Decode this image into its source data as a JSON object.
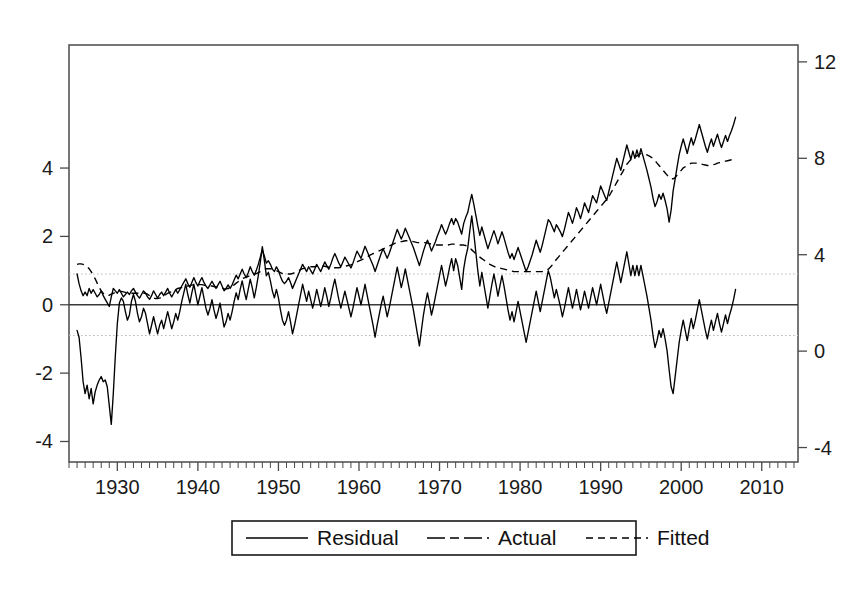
{
  "chart_data": {
    "type": "line",
    "title": "",
    "subtitle": "",
    "xlabel": "",
    "ylabel": "",
    "grid": false,
    "legend_position": "bottom-center",
    "x_start": 1925,
    "x_end": 2013,
    "x_tick_labels": [
      "1930",
      "1940",
      "1950",
      "1960",
      "1970",
      "1980",
      "1990",
      "2000",
      "2010"
    ],
    "x_tick_values": [
      1930,
      1940,
      1950,
      1960,
      1970,
      1980,
      1990,
      2000,
      2010
    ],
    "x_minor_tick_step": 1,
    "xlim": [
      1924,
      2014.5
    ],
    "left_axis": {
      "tick_labels": [
        "4",
        "2",
        "0",
        "-2",
        "-4"
      ],
      "tick_values": [
        4,
        2,
        0,
        -2,
        -4
      ],
      "ylim": [
        -4.6,
        7.6
      ],
      "applies_to": "Residual"
    },
    "right_axis": {
      "tick_labels": [
        "12",
        "8",
        "4",
        "0",
        "-4"
      ],
      "tick_values": [
        12,
        8,
        4,
        0,
        -4
      ],
      "ylim": [
        -4.6,
        12.7
      ],
      "applies_to": "Actual, Fitted"
    },
    "reference_lines": [
      {
        "name": "zero-line",
        "axis": "left",
        "value": 0,
        "style": "solid"
      },
      {
        "name": "upper-band",
        "axis": "left",
        "value": 0.9,
        "style": "dotted"
      },
      {
        "name": "lower-band",
        "axis": "left",
        "value": -0.9,
        "style": "dotted"
      }
    ],
    "series": [
      {
        "name": "Residual",
        "axis": "left",
        "style": "solid",
        "x_start": 1925.0,
        "x_step": 0.25,
        "values": [
          -0.75,
          -0.95,
          -1.55,
          -2.25,
          -2.6,
          -2.35,
          -2.75,
          -2.45,
          -2.9,
          -2.55,
          -2.35,
          -2.2,
          -2.1,
          -2.25,
          -2.2,
          -2.4,
          -2.95,
          -3.5,
          -2.6,
          -1.5,
          -0.55,
          0.05,
          0.2,
          0.1,
          -0.2,
          -0.45,
          -0.3,
          0.1,
          0.3,
          0.1,
          -0.25,
          -0.5,
          -0.35,
          -0.1,
          -0.25,
          -0.55,
          -0.85,
          -0.6,
          -0.35,
          -0.6,
          -0.85,
          -0.6,
          -0.45,
          -0.7,
          -0.45,
          -0.2,
          -0.45,
          -0.7,
          -0.5,
          -0.25,
          -0.45,
          -0.2,
          0.1,
          0.35,
          0.6,
          0.3,
          0.05,
          0.35,
          0.6,
          0.3,
          0.0,
          0.25,
          0.5,
          0.2,
          -0.1,
          -0.3,
          -0.1,
          0.15,
          -0.15,
          -0.4,
          -0.2,
          0.05,
          -0.3,
          -0.65,
          -0.5,
          -0.25,
          -0.45,
          -0.2,
          0.1,
          0.35,
          0.15,
          0.45,
          0.7,
          0.4,
          0.15,
          0.45,
          0.75,
          0.5,
          0.2,
          0.5,
          0.85,
          1.25,
          1.7,
          1.3,
          0.85,
          0.95,
          0.7,
          0.4,
          0.2,
          0.45,
          0.2,
          -0.15,
          -0.45,
          -0.6,
          -0.45,
          -0.2,
          -0.5,
          -0.85,
          -0.6,
          -0.3,
          0.0,
          0.3,
          0.6,
          0.35,
          0.1,
          0.4,
          0.15,
          -0.1,
          0.15,
          0.45,
          0.2,
          -0.05,
          0.2,
          0.5,
          0.25,
          -0.05,
          0.2,
          0.5,
          0.75,
          0.45,
          0.15,
          -0.1,
          0.15,
          0.4,
          0.15,
          -0.1,
          -0.35,
          -0.1,
          0.2,
          0.5,
          0.25,
          0.0,
          0.3,
          0.6,
          0.3,
          0.0,
          -0.3,
          -0.6,
          -0.95,
          -0.6,
          -0.3,
          0.0,
          0.25,
          -0.05,
          -0.35,
          -0.1,
          0.2,
          0.5,
          0.8,
          1.1,
          0.8,
          0.5,
          0.75,
          1.05,
          0.75,
          0.45,
          0.15,
          -0.15,
          -0.5,
          -0.85,
          -1.2,
          -0.75,
          -0.3,
          0.05,
          0.35,
          0.05,
          -0.3,
          -0.05,
          0.25,
          0.55,
          0.85,
          1.15,
          0.85,
          0.55,
          0.8,
          1.1,
          1.35,
          1.0,
          1.35,
          1.15,
          0.8,
          0.45,
          1.05,
          1.4,
          1.65,
          2.15,
          2.6,
          2.1,
          1.55,
          1.0,
          0.55,
          0.95,
          0.6,
          0.25,
          -0.1,
          0.25,
          0.6,
          0.9,
          0.6,
          0.25,
          0.55,
          0.85,
          0.55,
          0.2,
          -0.15,
          -0.45,
          -0.2,
          -0.5,
          -0.2,
          0.1,
          -0.2,
          -0.5,
          -0.8,
          -1.1,
          -0.8,
          -0.5,
          -0.2,
          0.1,
          0.4,
          0.1,
          -0.2,
          0.1,
          0.4,
          0.7,
          1.0,
          0.8,
          0.5,
          0.2,
          0.45,
          0.2,
          -0.05,
          -0.35,
          -0.1,
          0.2,
          0.5,
          0.2,
          -0.1,
          0.15,
          0.45,
          0.15,
          -0.15,
          0.1,
          0.4,
          0.15,
          -0.1,
          0.2,
          0.5,
          0.25,
          0.0,
          0.3,
          0.6,
          0.3,
          0.0,
          -0.25,
          0.05,
          0.35,
          0.65,
          0.95,
          1.25,
          0.95,
          0.65,
          0.95,
          1.25,
          1.55,
          1.2,
          0.85,
          1.15,
          0.85,
          1.15,
          0.85,
          1.15,
          0.85,
          0.55,
          0.25,
          -0.1,
          -0.45,
          -0.9,
          -1.25,
          -1.05,
          -0.75,
          -0.95,
          -0.7,
          -1.0,
          -1.35,
          -1.9,
          -2.4,
          -2.6,
          -2.1,
          -1.6,
          -1.1,
          -0.75,
          -0.45,
          -0.75,
          -1.05,
          -0.7,
          -0.4,
          -0.7,
          -0.45,
          -0.15,
          0.15,
          -0.15,
          -0.45,
          -0.75,
          -1.0,
          -0.7,
          -0.45,
          -0.75,
          -0.5,
          -0.25,
          -0.55,
          -0.8,
          -0.55,
          -0.3,
          -0.55,
          -0.3,
          -0.1,
          0.15,
          0.45
        ]
      },
      {
        "name": "Actual",
        "axis": "right",
        "style": "dash-dot",
        "x_start": 1925.0,
        "x_step": 0.25,
        "values": [
          3.2,
          2.8,
          2.5,
          2.3,
          2.45,
          2.3,
          2.6,
          2.4,
          2.55,
          2.4,
          2.25,
          2.35,
          2.5,
          2.3,
          2.15,
          2.0,
          1.85,
          2.25,
          2.6,
          2.5,
          2.4,
          2.55,
          2.4,
          2.25,
          2.35,
          2.45,
          2.35,
          2.5,
          2.6,
          2.45,
          2.3,
          2.2,
          2.35,
          2.5,
          2.4,
          2.25,
          2.15,
          2.3,
          2.5,
          2.35,
          2.2,
          2.35,
          2.45,
          2.3,
          2.45,
          2.6,
          2.4,
          2.25,
          2.4,
          2.55,
          2.4,
          2.55,
          2.7,
          2.85,
          3.0,
          2.8,
          2.65,
          2.85,
          3.05,
          2.85,
          2.7,
          2.9,
          3.05,
          2.85,
          2.7,
          2.6,
          2.75,
          2.9,
          2.75,
          2.6,
          2.75,
          2.9,
          2.7,
          2.5,
          2.6,
          2.75,
          2.6,
          2.75,
          2.95,
          3.15,
          3.0,
          3.2,
          3.4,
          3.2,
          3.05,
          3.25,
          3.5,
          3.3,
          3.15,
          3.35,
          3.6,
          3.9,
          4.2,
          3.95,
          3.65,
          3.75,
          3.6,
          3.4,
          3.3,
          3.5,
          3.35,
          3.1,
          2.9,
          2.8,
          2.9,
          3.05,
          2.85,
          2.6,
          2.8,
          3.0,
          3.2,
          3.4,
          3.6,
          3.45,
          3.3,
          3.5,
          3.35,
          3.2,
          3.4,
          3.6,
          3.45,
          3.3,
          3.5,
          3.7,
          3.55,
          3.4,
          3.6,
          3.85,
          4.05,
          3.85,
          3.65,
          3.5,
          3.7,
          3.9,
          3.75,
          3.6,
          3.45,
          3.65,
          3.9,
          4.15,
          4.0,
          3.85,
          4.1,
          4.35,
          4.15,
          3.95,
          3.75,
          3.55,
          3.3,
          3.55,
          3.8,
          4.05,
          4.25,
          4.05,
          3.85,
          4.05,
          4.3,
          4.55,
          4.8,
          5.05,
          4.85,
          4.65,
          4.85,
          5.1,
          4.9,
          4.7,
          4.5,
          4.3,
          4.05,
          3.8,
          3.55,
          3.85,
          4.15,
          4.4,
          4.6,
          4.4,
          4.15,
          4.35,
          4.55,
          4.8,
          5.0,
          5.25,
          5.05,
          4.85,
          5.05,
          5.3,
          5.5,
          5.25,
          5.5,
          5.35,
          5.1,
          4.85,
          5.3,
          5.55,
          5.75,
          6.15,
          6.5,
          6.1,
          5.65,
          5.2,
          4.8,
          5.15,
          4.85,
          4.55,
          4.25,
          4.5,
          4.75,
          5.0,
          4.75,
          4.45,
          4.7,
          4.95,
          4.7,
          4.4,
          4.1,
          3.85,
          4.05,
          3.8,
          4.05,
          4.3,
          4.05,
          3.8,
          3.55,
          3.3,
          3.5,
          3.75,
          4.0,
          4.3,
          4.6,
          4.35,
          4.1,
          4.4,
          4.75,
          5.1,
          5.45,
          5.35,
          5.15,
          4.95,
          5.25,
          5.1,
          4.95,
          4.75,
          5.05,
          5.4,
          5.75,
          5.55,
          5.3,
          5.6,
          5.95,
          5.75,
          5.5,
          5.8,
          6.15,
          5.95,
          5.75,
          6.1,
          6.45,
          6.3,
          6.15,
          6.5,
          6.85,
          6.65,
          6.45,
          6.25,
          6.6,
          6.95,
          7.3,
          7.65,
          8.0,
          7.75,
          7.5,
          7.85,
          8.2,
          8.55,
          8.25,
          7.95,
          8.3,
          8.0,
          8.35,
          8.05,
          8.4,
          8.1,
          7.8,
          7.5,
          7.15,
          6.8,
          6.35,
          6.0,
          6.2,
          6.5,
          6.3,
          6.55,
          6.25,
          5.9,
          5.35,
          5.85,
          6.65,
          7.15,
          7.65,
          8.15,
          8.5,
          8.8,
          8.5,
          8.2,
          8.55,
          8.85,
          8.55,
          8.8,
          9.1,
          9.4,
          9.1,
          8.8,
          8.5,
          8.25,
          8.55,
          8.8,
          8.5,
          8.75,
          9.0,
          8.7,
          8.45,
          8.7,
          8.95,
          8.7,
          8.95,
          9.15,
          9.4,
          9.7
        ]
      },
      {
        "name": "Fitted",
        "axis": "right",
        "style": "dashed",
        "x_start": 1925.0,
        "x_step": 0.25,
        "values": [
          3.6,
          3.62,
          3.62,
          3.6,
          3.56,
          3.5,
          3.42,
          3.3,
          3.15,
          3.0,
          2.82,
          2.65,
          2.5,
          2.4,
          2.33,
          2.3,
          2.32,
          2.36,
          2.4,
          2.44,
          2.46,
          2.48,
          2.48,
          2.46,
          2.44,
          2.42,
          2.4,
          2.4,
          2.4,
          2.4,
          2.4,
          2.4,
          2.4,
          2.4,
          2.4,
          2.36,
          2.3,
          2.24,
          2.2,
          2.18,
          2.18,
          2.2,
          2.24,
          2.28,
          2.34,
          2.4,
          2.44,
          2.46,
          2.5,
          2.55,
          2.6,
          2.62,
          2.64,
          2.66,
          2.68,
          2.7,
          2.72,
          2.74,
          2.76,
          2.76,
          2.76,
          2.76,
          2.76,
          2.74,
          2.72,
          2.7,
          2.7,
          2.7,
          2.68,
          2.66,
          2.66,
          2.66,
          2.62,
          2.58,
          2.58,
          2.6,
          2.62,
          2.68,
          2.75,
          2.82,
          2.88,
          2.94,
          3.0,
          3.04,
          3.06,
          3.1,
          3.14,
          3.16,
          3.18,
          3.22,
          3.26,
          3.3,
          3.36,
          3.4,
          3.42,
          3.42,
          3.42,
          3.4,
          3.36,
          3.34,
          3.3,
          3.26,
          3.22,
          3.2,
          3.2,
          3.2,
          3.2,
          3.22,
          3.26,
          3.3,
          3.34,
          3.38,
          3.42,
          3.44,
          3.46,
          3.48,
          3.5,
          3.5,
          3.5,
          3.52,
          3.52,
          3.52,
          3.52,
          3.52,
          3.5,
          3.48,
          3.46,
          3.46,
          3.46,
          3.46,
          3.46,
          3.48,
          3.5,
          3.52,
          3.54,
          3.56,
          3.58,
          3.62,
          3.66,
          3.7,
          3.74,
          3.78,
          3.82,
          3.86,
          3.9,
          3.96,
          4.0,
          4.04,
          4.08,
          4.12,
          4.16,
          4.2,
          4.24,
          4.28,
          4.32,
          4.36,
          4.4,
          4.44,
          4.48,
          4.5,
          4.52,
          4.54,
          4.56,
          4.58,
          4.58,
          4.58,
          4.56,
          4.54,
          4.52,
          4.5,
          4.5,
          4.5,
          4.5,
          4.5,
          4.48,
          4.46,
          4.44,
          4.42,
          4.4,
          4.4,
          4.4,
          4.4,
          4.4,
          4.4,
          4.4,
          4.42,
          4.44,
          4.44,
          4.44,
          4.42,
          4.4,
          4.4,
          4.4,
          4.38,
          4.34,
          4.28,
          4.2,
          4.12,
          4.04,
          3.96,
          3.9,
          3.84,
          3.78,
          3.72,
          3.66,
          3.6,
          3.56,
          3.52,
          3.48,
          3.46,
          3.44,
          3.42,
          3.4,
          3.38,
          3.36,
          3.34,
          3.32,
          3.3,
          3.3,
          3.3,
          3.3,
          3.3,
          3.3,
          3.3,
          3.3,
          3.3,
          3.3,
          3.3,
          3.3,
          3.3,
          3.3,
          3.3,
          3.32,
          3.34,
          3.4,
          3.48,
          3.58,
          3.7,
          3.8,
          3.9,
          4.0,
          4.1,
          4.2,
          4.3,
          4.4,
          4.5,
          4.6,
          4.7,
          4.8,
          4.9,
          5.0,
          5.1,
          5.2,
          5.3,
          5.4,
          5.5,
          5.6,
          5.7,
          5.8,
          5.9,
          6.0,
          6.1,
          6.2,
          6.3,
          6.4,
          6.55,
          6.7,
          6.85,
          7.0,
          7.15,
          7.3,
          7.45,
          7.6,
          7.75,
          7.85,
          7.95,
          8.0,
          8.05,
          8.1,
          8.15,
          8.2,
          8.2,
          8.18,
          8.14,
          8.1,
          8.05,
          8.0,
          7.9,
          7.8,
          7.7,
          7.6,
          7.5,
          7.4,
          7.3,
          7.2,
          7.15,
          7.15,
          7.2,
          7.3,
          7.4,
          7.5,
          7.6,
          7.65,
          7.7,
          7.75,
          7.8,
          7.8,
          7.8,
          7.8,
          7.78,
          7.76,
          7.74,
          7.72,
          7.7,
          7.7,
          7.72,
          7.74,
          7.76,
          7.8,
          7.82,
          7.84,
          7.86,
          7.88,
          7.9,
          7.92,
          7.94,
          7.96,
          8.0
        ]
      }
    ],
    "legend": [
      {
        "label": "Residual",
        "style": "solid"
      },
      {
        "label": "Actual",
        "style": "dash-dot"
      },
      {
        "label": "Fitted",
        "style": "dashed"
      }
    ]
  },
  "colors": {
    "line": "#000000",
    "axis": "#4a4a4a",
    "band": "#b9b9c4",
    "background": "#ffffff"
  }
}
